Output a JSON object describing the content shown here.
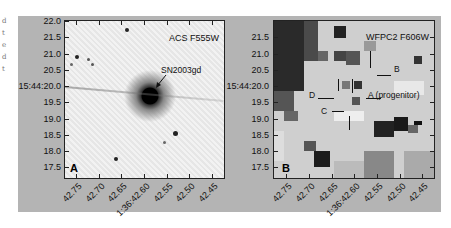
{
  "margin_text": [
    "d",
    "t",
    "e",
    "d",
    "t"
  ],
  "panels": [
    {
      "letter": "A",
      "title": "ACS F555W",
      "annotation": "SN2003gd",
      "y_ticks": [
        "22.0",
        "21.5",
        "21.0",
        "20.5",
        "15:44:20.0",
        "19.5",
        "19.0",
        "18.5",
        "18.0",
        "17.5"
      ],
      "x_ticks": [
        "42.75",
        "42.70",
        "42.65",
        "1:36:42.60",
        "42.55",
        "42.50",
        "42.45"
      ]
    },
    {
      "letter": "B",
      "title": "WFPC2 F606W",
      "annotations": [
        "A (progenitor)",
        "B",
        "C",
        "D"
      ],
      "y_ticks": [
        "21.5",
        "21.0",
        "20.5",
        "15:44:20.0",
        "19.5",
        "19.0",
        "18.5",
        "18.0",
        "17.5"
      ],
      "x_ticks": [
        "42.75",
        "42.70",
        "42.65",
        "1:36:42.60",
        "42.55",
        "42.50",
        "42.45"
      ]
    }
  ]
}
